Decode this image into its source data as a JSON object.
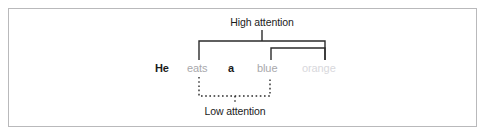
{
  "figure": {
    "frame_color": "#b9b9bb",
    "background": "#ffffff"
  },
  "labels": {
    "high_attention": "High attention",
    "low_attention": "Low attention",
    "label_color": "#1b1b1b"
  },
  "sentence": {
    "tokens": [
      {
        "text": "He",
        "color": "#1b1b1b",
        "weight": "bold",
        "x": 155
      },
      {
        "text": "eats",
        "color": "#a8a8ac",
        "weight": "normal",
        "x": 187
      },
      {
        "text": "a",
        "color": "#1b1b1b",
        "weight": "bold",
        "x": 228
      },
      {
        "text": "blue",
        "color": "#a8a8ac",
        "weight": "normal",
        "x": 257
      },
      {
        "text": "orange",
        "color": "#d8d8dc",
        "weight": "normal",
        "x": 302
      }
    ]
  },
  "brackets": {
    "high_attention": {
      "style": "solid",
      "color": "#2b2b2b",
      "stroke_width": 1.4,
      "outer": {
        "x1": 199,
        "x2": 325,
        "y_top": 41,
        "y_bottom": 60
      },
      "inner": {
        "x1": 271,
        "x2": 325,
        "y_top": 48,
        "y_bottom": 60
      },
      "stem": {
        "x": 262,
        "y_top": 30,
        "y_bottom": 41
      }
    },
    "low_attention": {
      "style": "dotted",
      "color": "#2b2b2b",
      "stroke_width": 1.4,
      "dash_pattern": "1.6 2.6",
      "bracket": {
        "x1": 199,
        "x2": 270,
        "y_top": 77,
        "y_bottom": 96
      },
      "stem": {
        "x": 235,
        "y_top": 96,
        "y_bottom": 104
      }
    }
  }
}
